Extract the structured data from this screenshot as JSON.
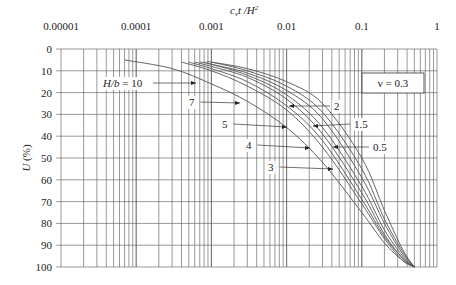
{
  "chart_data": {
    "type": "line",
    "title": "",
    "xlabel": "c_v t / H^2",
    "ylabel": "U (%)",
    "xscale": "log",
    "xlim": [
      1e-05,
      1
    ],
    "ylim": [
      0,
      100
    ],
    "y_inverted": true,
    "grid": true,
    "x_tick_labels": [
      "0.00001",
      "0.0001",
      "0.001",
      "0.01",
      "0.1",
      "1"
    ],
    "y_tick_labels": [
      "0",
      "10",
      "20",
      "30",
      "40",
      "50",
      "60",
      "70",
      "80",
      "90",
      "100"
    ],
    "annotation_box": "ν = 0.3",
    "series": [
      {
        "name": "H/b = 10",
        "x": [
          7e-05,
          0.0003,
          0.001,
          0.003,
          0.01,
          0.03,
          0.1,
          0.2,
          0.35,
          0.5
        ],
        "y": [
          5,
          9,
          16,
          24,
          36,
          52,
          75,
          89,
          97,
          100
        ]
      },
      {
        "name": "7",
        "x": [
          0.0004,
          0.001,
          0.003,
          0.01,
          0.03,
          0.1,
          0.2,
          0.35,
          0.5
        ],
        "y": [
          6,
          10,
          17,
          28,
          45,
          71,
          87,
          97,
          100
        ]
      },
      {
        "name": "5",
        "x": [
          0.0005,
          0.001,
          0.003,
          0.01,
          0.03,
          0.1,
          0.2,
          0.35,
          0.5
        ],
        "y": [
          6,
          9,
          15,
          26,
          42,
          69,
          86,
          96,
          100
        ]
      },
      {
        "name": "4",
        "x": [
          0.0006,
          0.001,
          0.003,
          0.01,
          0.03,
          0.1,
          0.2,
          0.35,
          0.5
        ],
        "y": [
          6,
          8,
          13,
          23,
          39,
          66,
          85,
          96,
          100
        ]
      },
      {
        "name": "3",
        "x": [
          0.0007,
          0.001,
          0.003,
          0.01,
          0.03,
          0.1,
          0.2,
          0.35,
          0.5
        ],
        "y": [
          6,
          7,
          12,
          21,
          36,
          63,
          83,
          95,
          100
        ]
      },
      {
        "name": "2",
        "x": [
          0.0008,
          0.001,
          0.003,
          0.01,
          0.03,
          0.1,
          0.2,
          0.35,
          0.5
        ],
        "y": [
          6,
          7,
          11,
          19,
          32,
          59,
          80,
          94,
          100
        ]
      },
      {
        "name": "1.5",
        "x": [
          0.0009,
          0.001,
          0.003,
          0.01,
          0.03,
          0.1,
          0.2,
          0.35,
          0.5
        ],
        "y": [
          6,
          6,
          10,
          17,
          29,
          55,
          78,
          93,
          100
        ]
      },
      {
        "name": "0.5",
        "x": [
          0.001,
          0.003,
          0.01,
          0.03,
          0.1,
          0.2,
          0.35,
          0.5
        ],
        "y": [
          6,
          9,
          15,
          25,
          50,
          74,
          92,
          100
        ]
      }
    ],
    "labels": [
      {
        "text": "H/b = 10",
        "lx": 103,
        "ly": 87,
        "ax": 196,
        "ay": 83
      },
      {
        "text": "7",
        "lx": 189,
        "ly": 106,
        "ax": 240,
        "ay": 103
      },
      {
        "text": "5",
        "lx": 222,
        "ly": 128,
        "ax": 287,
        "ay": 127
      },
      {
        "text": "4",
        "lx": 246,
        "ly": 149,
        "ax": 310,
        "ay": 148
      },
      {
        "text": "3",
        "lx": 268,
        "ly": 171,
        "ax": 333,
        "ay": 169
      },
      {
        "text": "2",
        "lx": 334,
        "ly": 110,
        "ax": 289,
        "ay": 106
      },
      {
        "text": "1.5",
        "lx": 354,
        "ly": 128,
        "ax": 313,
        "ay": 126
      },
      {
        "text": "0.5",
        "lx": 373,
        "ly": 151,
        "ax": 333,
        "ay": 147
      }
    ]
  }
}
